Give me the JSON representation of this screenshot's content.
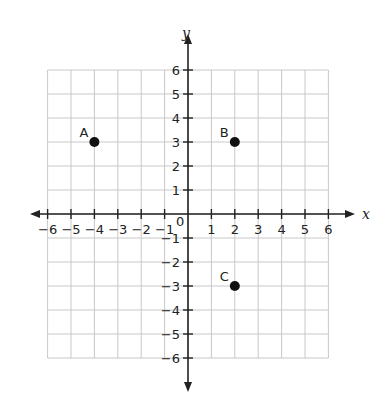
{
  "chart_data": {
    "type": "scatter",
    "title": "",
    "xlabel": "x",
    "ylabel": "y",
    "xlim": [
      -6,
      6
    ],
    "ylim": [
      -6,
      6
    ],
    "grid": true,
    "origin_label": "0",
    "x_ticks": [
      -6,
      -5,
      -4,
      -3,
      -2,
      -1,
      1,
      2,
      3,
      4,
      5,
      6
    ],
    "y_ticks": [
      -6,
      -5,
      -4,
      -3,
      -2,
      -1,
      1,
      2,
      3,
      4,
      5,
      6
    ],
    "points": [
      {
        "label": "A",
        "x": -4,
        "y": 3
      },
      {
        "label": "B",
        "x": 2,
        "y": 3
      },
      {
        "label": "C",
        "x": 2,
        "y": -3
      }
    ]
  },
  "colors": {
    "grid": "#c8c8c8",
    "axis": "#222222",
    "point": "#111111"
  }
}
